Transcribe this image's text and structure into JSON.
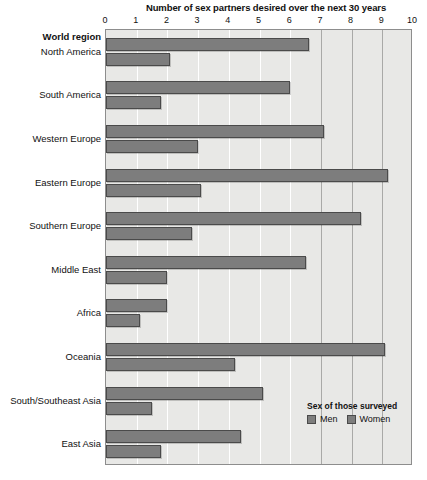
{
  "chart_data": {
    "type": "bar",
    "orientation": "horizontal",
    "title": "Number of sex partners desired over the next 30 years",
    "xlabel": "",
    "ylabel": "World region",
    "xlim": [
      0,
      10
    ],
    "xticks": [
      "0",
      "1",
      "2",
      "3",
      "4",
      "5",
      "6",
      "7",
      "8",
      "9",
      "10"
    ],
    "grid": true,
    "legend_position": "inside-bottom-right",
    "categories": [
      "North America",
      "South America",
      "Western Europe",
      "Eastern Europe",
      "Southern Europe",
      "Middle East",
      "Africa",
      "Oceania",
      "South/Southeast Asia",
      "East Asia"
    ],
    "series": [
      {
        "name": "Men",
        "values": [
          6.6,
          6.0,
          7.1,
          9.2,
          8.3,
          6.5,
          2.0,
          9.1,
          5.1,
          4.4
        ]
      },
      {
        "name": "Women",
        "values": [
          2.1,
          1.8,
          3.0,
          3.1,
          2.8,
          2.0,
          1.1,
          4.2,
          1.5,
          1.8
        ]
      }
    ],
    "colors": {
      "men": "#7d7d7d",
      "women": "#7d7d7d",
      "bar_border": "#4a4a4a",
      "plot_background": "#e8e8e6",
      "gridline": "#ffffff",
      "gridline_major": "#a9a9a7",
      "frame": "#8d8d8d",
      "text": "#111111"
    }
  },
  "legend": {
    "title": "Sex of those surveyed",
    "entries": [
      {
        "label": "Men"
      },
      {
        "label": "Women"
      }
    ]
  },
  "axis": {
    "y_axis_heading": "World region"
  }
}
